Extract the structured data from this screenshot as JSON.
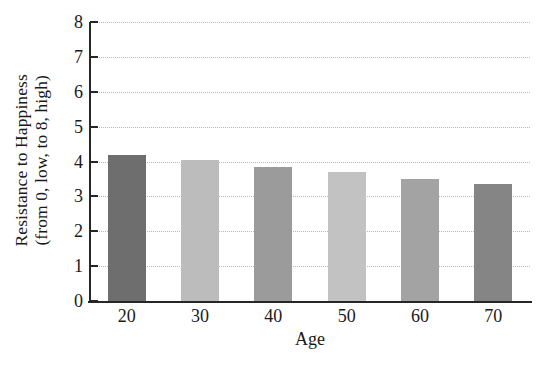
{
  "chart_data": {
    "type": "bar",
    "title": "",
    "categories": [
      "20",
      "30",
      "40",
      "50",
      "60",
      "70"
    ],
    "values": [
      4.2,
      4.05,
      3.85,
      3.7,
      3.5,
      3.35
    ],
    "series": [
      {
        "name": "Resistance to Happiness",
        "values": [
          4.2,
          4.05,
          3.85,
          3.7,
          3.5,
          3.35
        ]
      }
    ],
    "bar_colors": [
      "#6e6e6e",
      "#bcbcbc",
      "#9b9b9b",
      "#c2c2c2",
      "#a3a3a3",
      "#858585"
    ],
    "xlabel": "Age",
    "ylabel_line1": "Resistance to Happiness",
    "ylabel_line2": "(from 0, low, to 8, high)",
    "ylim": [
      0,
      8
    ],
    "yticks": [
      0,
      1,
      2,
      3,
      4,
      5,
      6,
      7,
      8
    ],
    "ytick_labels": [
      "0",
      "1",
      "2",
      "3",
      "4",
      "5",
      "6",
      "7",
      "8"
    ],
    "grid": true,
    "grid_axis": "y",
    "grid_style": "dotted",
    "grid_color": "#b9b9b9",
    "legend": false,
    "legend_position": "none",
    "axis_color": "#262626",
    "background": "#ffffff"
  }
}
